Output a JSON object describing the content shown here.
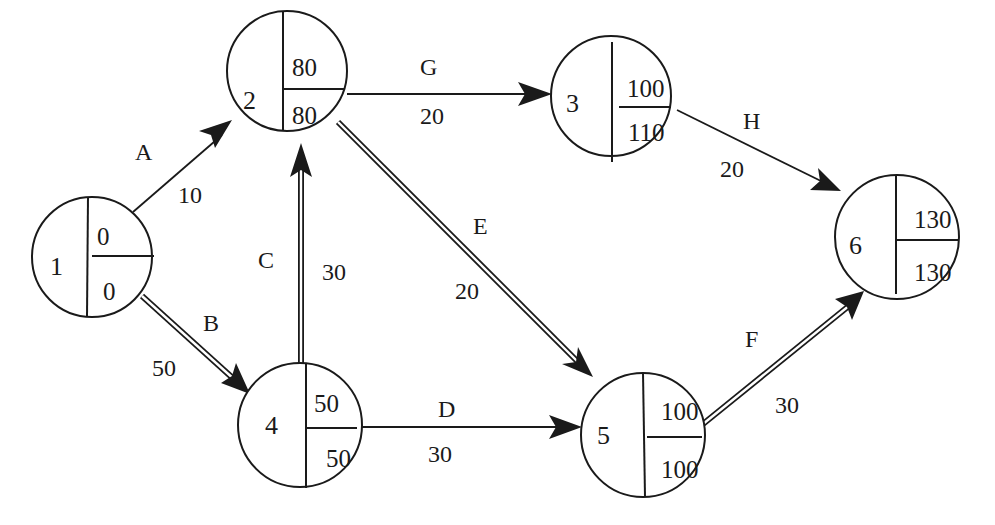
{
  "diagram": {
    "type": "activity-on-arrow network (critical path)",
    "background": "#ffffff",
    "line_color": "#1a1a1a",
    "nodes": [
      {
        "id": "1",
        "top": "0",
        "bottom": "0",
        "cx": 92,
        "cy": 257,
        "r": 60
      },
      {
        "id": "2",
        "top": "80",
        "bottom": "80",
        "cx": 287,
        "cy": 71,
        "r": 60
      },
      {
        "id": "3",
        "top": "100",
        "bottom": "110",
        "cx": 611,
        "cy": 96,
        "r": 60
      },
      {
        "id": "4",
        "top": "50",
        "bottom": "50",
        "cx": 300,
        "cy": 425,
        "r": 62
      },
      {
        "id": "5",
        "top": "100",
        "bottom": "100",
        "cx": 643,
        "cy": 435,
        "r": 62
      },
      {
        "id": "6",
        "top": "130",
        "bottom": "130",
        "cx": 897,
        "cy": 237,
        "r": 62
      }
    ],
    "edges": [
      {
        "name": "A",
        "duration": "10",
        "from": "1",
        "to": "2",
        "critical": false
      },
      {
        "name": "B",
        "duration": "50",
        "from": "1",
        "to": "4",
        "critical": true
      },
      {
        "name": "C",
        "duration": "30",
        "from": "4",
        "to": "2",
        "critical": true
      },
      {
        "name": "D",
        "duration": "30",
        "from": "4",
        "to": "5",
        "critical": false
      },
      {
        "name": "E",
        "duration": "20",
        "from": "2",
        "to": "5",
        "critical": true
      },
      {
        "name": "F",
        "duration": "30",
        "from": "5",
        "to": "6",
        "critical": true
      },
      {
        "name": "G",
        "duration": "20",
        "from": "2",
        "to": "3",
        "critical": false
      },
      {
        "name": "H",
        "duration": "20",
        "from": "3",
        "to": "6",
        "critical": false
      }
    ]
  },
  "labels": {
    "n1": {
      "id": "1",
      "top": "0",
      "bottom": "0"
    },
    "n2": {
      "id": "2",
      "top": "80",
      "bottom": "80"
    },
    "n3": {
      "id": "3",
      "top": "100",
      "bottom": "110"
    },
    "n4": {
      "id": "4",
      "top": "50",
      "bottom": "50"
    },
    "n5": {
      "id": "5",
      "top": "100",
      "bottom": "100"
    },
    "n6": {
      "id": "6",
      "top": "130",
      "bottom": "130"
    },
    "eA": {
      "name": "A",
      "duration": "10"
    },
    "eB": {
      "name": "B",
      "duration": "50"
    },
    "eC": {
      "name": "C",
      "duration": "30"
    },
    "eD": {
      "name": "D",
      "duration": "30"
    },
    "eE": {
      "name": "E",
      "duration": "20"
    },
    "eF": {
      "name": "F",
      "duration": "30"
    },
    "eG": {
      "name": "G",
      "duration": "20"
    },
    "eH": {
      "name": "H",
      "duration": "20"
    }
  }
}
